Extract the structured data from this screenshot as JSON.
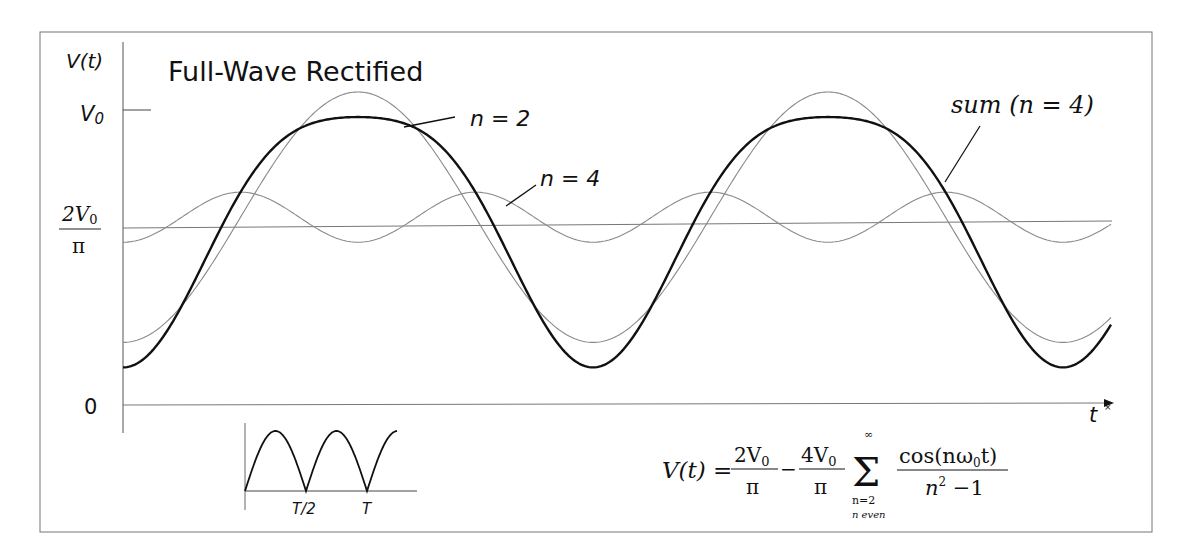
{
  "title": "Full-Wave Rectified",
  "y_axis": {
    "label": "V(t)",
    "ticks": [
      {
        "id": "v0",
        "label": "V0",
        "label_main": "V",
        "label_sub": "0"
      },
      {
        "id": "avg",
        "label": "2V0/π",
        "numerator": "2V",
        "numerator_sub": "0",
        "denominator": "π"
      },
      {
        "id": "zero",
        "label": "0"
      }
    ]
  },
  "x_axis": {
    "label": "t",
    "marker": "×"
  },
  "annotations": [
    {
      "id": "n2",
      "text": "n = 2"
    },
    {
      "id": "n4",
      "text": "n = 4"
    },
    {
      "id": "sum",
      "text": "sum  (n = 4)"
    }
  ],
  "inset": {
    "description": "Full-wave rectified waveform |sin|",
    "ticks": [
      "T/2",
      "T"
    ]
  },
  "formula": {
    "lhs": "V(t) =",
    "term1_num": "2V",
    "term1_num_sub": "0",
    "term1_den": "π",
    "minus": "−",
    "term2_num": "4V",
    "term2_num_sub": "0",
    "term2_den": "π",
    "sum_symbol": "Σ",
    "sum_upper": "∞",
    "sum_lower": "n=2",
    "sum_condition": "n  even",
    "frac_num": "cos(nω",
    "frac_num_sub": "0",
    "frac_num_end": "t)",
    "frac_den": "n",
    "frac_den_sup": "2",
    "frac_den_end": " −1"
  },
  "chart_data": {
    "type": "line",
    "title": "Full-Wave Rectified",
    "xlabel": "t",
    "ylabel": "V(t)",
    "y_ticks": [
      "0",
      "2V0/π",
      "V0"
    ],
    "ylim_normalized": [
      0,
      1
    ],
    "xlim_periods": [
      0,
      2.1
    ],
    "grid": false,
    "legend": "inline annotations",
    "series": [
      {
        "name": "n = 2",
        "style": "thin",
        "expression": "2/π − (4/π)(1/3)cos(2ω0t)",
        "min_norm": 0.212,
        "max_norm": 1.061,
        "peak_positions_periods": [
          0.5,
          1.5
        ]
      },
      {
        "name": "n = 4",
        "style": "thin",
        "expression": "2/π − (4/π)(1/15)cos(4ω0t)",
        "min_norm": 0.552,
        "max_norm": 0.722
      },
      {
        "name": "sum (n = 4)",
        "style": "thick",
        "expression": "2/π − (4/π)[cos(2ω0t)/3 + cos(4ω0t)/15]",
        "min_norm": 0.127,
        "max_norm": 0.976
      },
      {
        "name": "2V0/π (DC average)",
        "style": "thin-horizontal",
        "value_norm": 0.637
      }
    ],
    "annotations": [
      "n = 2",
      "n = 4",
      "sum (n = 4)"
    ],
    "inset_series": {
      "name": "full-wave rectified |sin(ωt)|",
      "x_ticks": [
        "T/2",
        "T"
      ],
      "arches": 2.5
    }
  }
}
